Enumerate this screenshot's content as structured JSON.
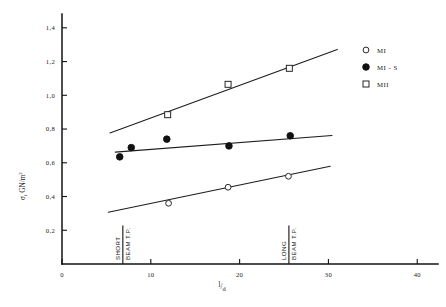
{
  "chart_data": {
    "type": "scatter",
    "title": "",
    "xlabel": "l/d",
    "ylabel": "σf  GN/m2",
    "ylabel_symbol": "σ",
    "ylabel_subscript": "f",
    "ylabel_units": "GN/m",
    "ylabel_units_exponent": "2",
    "xlabel_numerator": "l",
    "xlabel_slash": "/",
    "xlabel_denominator": "d",
    "xlim": [
      0,
      42
    ],
    "ylim": [
      0,
      1.47
    ],
    "xticks": [
      0,
      10,
      20,
      30,
      40
    ],
    "xtick_labels": [
      "0",
      "10",
      "20",
      "30",
      "40"
    ],
    "yticks": [
      0.2,
      0.4,
      0.6,
      0.8,
      1.0,
      1.2,
      1.4
    ],
    "ytick_labels": [
      "0,2",
      "0,4",
      "0,6",
      "0,8",
      "1,0",
      "1,2",
      "1,4"
    ],
    "grid": false,
    "legend_position": "top-right",
    "decimal_separator": ",",
    "series": [
      {
        "name": "MI",
        "marker": "open-circle",
        "x": [
          12.0,
          18.7,
          25.5
        ],
        "y": [
          0.36,
          0.455,
          0.52
        ],
        "fit_line": {
          "x": [
            5.2,
            30.2
          ],
          "y": [
            0.307,
            0.58
          ]
        }
      },
      {
        "name": "MI - S",
        "marker": "filled-circle",
        "x": [
          6.5,
          7.8,
          11.8,
          18.8,
          25.7
        ],
        "y": [
          0.635,
          0.69,
          0.74,
          0.7,
          0.76
        ],
        "fit_line": {
          "x": [
            6.0,
            30.4
          ],
          "y": [
            0.663,
            0.762
          ]
        }
      },
      {
        "name": "MII",
        "marker": "open-square",
        "x": [
          11.9,
          18.7,
          25.6
        ],
        "y": [
          0.885,
          1.065,
          1.16
        ],
        "fit_line": {
          "x": [
            5.4,
            31.0
          ],
          "y": [
            0.777,
            1.272
          ]
        }
      }
    ],
    "annotations": [
      {
        "x": 6.85,
        "line_top_y": 0.228,
        "line_bottom_y": 0.0,
        "label_left": "SHORT",
        "label_right": "BEAM T.P."
      },
      {
        "x": 25.55,
        "line_top_y": 0.228,
        "line_bottom_y": 0.0,
        "label_left": "LONG",
        "label_right": "BEAM T.P."
      }
    ]
  },
  "legend": {
    "entries": [
      {
        "label": "MI",
        "marker": "open-circle"
      },
      {
        "label": "MI - S",
        "marker": "filled-circle"
      },
      {
        "label": "MII",
        "marker": "open-square"
      }
    ]
  },
  "colors": {
    "axis": "#121212",
    "line": "#1c1c1c",
    "marker_fill_open": "#ffffff",
    "marker_fill_solid": "#111111",
    "text": "#1a1a1a",
    "background": "#ffffff"
  }
}
